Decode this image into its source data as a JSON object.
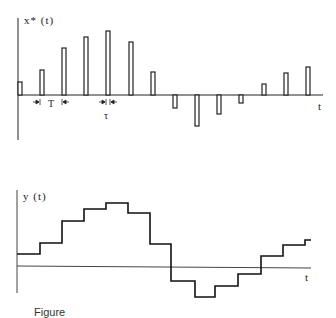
{
  "top_plot": {
    "ylabel": "x* (t)",
    "xlabel": "t",
    "period_label": "T",
    "pulse_width_label": "τ",
    "baseline_y": 95,
    "axis_x": 18,
    "axis_end_x": 323,
    "pulse_width_px": 4,
    "pulses": [
      {
        "x": 18,
        "top": 82
      },
      {
        "x": 40,
        "top": 70
      },
      {
        "x": 62,
        "top": 48
      },
      {
        "x": 84,
        "top": 37
      },
      {
        "x": 106,
        "top": 31
      },
      {
        "x": 129,
        "top": 42
      },
      {
        "x": 151,
        "top": 72
      },
      {
        "x": 173,
        "bottom": 108
      },
      {
        "x": 195,
        "bottom": 126
      },
      {
        "x": 217,
        "bottom": 114
      },
      {
        "x": 239,
        "bottom": 103
      },
      {
        "x": 262,
        "top": 84
      },
      {
        "x": 284,
        "top": 73
      },
      {
        "x": 306,
        "top": 67
      }
    ]
  },
  "bottom_plot": {
    "ylabel": "y (t)",
    "xlabel": "t",
    "baseline_y": 266,
    "axis_x": 17,
    "axis_end_x": 311,
    "steps": [
      {
        "x0": 17,
        "x1": 40,
        "y": 254
      },
      {
        "x0": 40,
        "x1": 62,
        "y": 243
      },
      {
        "x0": 62,
        "x1": 84,
        "y": 221
      },
      {
        "x0": 84,
        "x1": 106,
        "y": 209
      },
      {
        "x0": 106,
        "x1": 128,
        "y": 203
      },
      {
        "x0": 128,
        "x1": 150,
        "y": 213
      },
      {
        "x0": 150,
        "x1": 171,
        "y": 244
      },
      {
        "x0": 171,
        "x1": 195,
        "y": 281
      },
      {
        "x0": 195,
        "x1": 215,
        "y": 297
      },
      {
        "x0": 215,
        "x1": 238,
        "y": 286
      },
      {
        "x0": 238,
        "x1": 261,
        "y": 274
      },
      {
        "x0": 261,
        "x1": 283,
        "y": 256
      },
      {
        "x0": 283,
        "x1": 305,
        "y": 245
      },
      {
        "x0": 305,
        "x1": 311,
        "y": 240
      }
    ]
  },
  "caption": "Figure"
}
